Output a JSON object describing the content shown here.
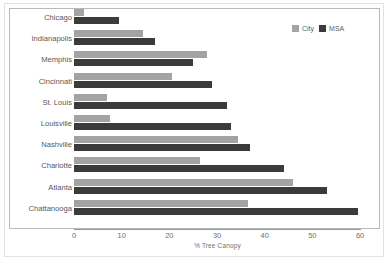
{
  "chart_data": {
    "type": "bar",
    "orientation": "horizontal",
    "title": "",
    "xlabel": "% Tree Canopy",
    "ylabel": "",
    "xlim": [
      0,
      60
    ],
    "xticks": [
      0,
      10,
      20,
      30,
      40,
      50,
      60
    ],
    "grid": false,
    "legend_position": "top-right",
    "categories": [
      "Chicago",
      "Indianapolis",
      "Memphis",
      "Cincinnati",
      "St. Louis",
      "Louisville",
      "Nashville",
      "Charlotte",
      "Atlanta",
      "Chattanooga"
    ],
    "series": [
      {
        "name": "City",
        "color": "#a3a3a3",
        "values": [
          2,
          14.5,
          28,
          20.5,
          7,
          7.5,
          34.5,
          26.5,
          46,
          36.5
        ]
      },
      {
        "name": "MSA",
        "color": "#3b3b3b",
        "values": [
          9.5,
          17,
          25,
          29,
          32,
          33,
          37,
          44,
          53,
          59.5
        ]
      }
    ]
  },
  "legend": {
    "items": [
      {
        "label": "City",
        "color": "#a3a3a3"
      },
      {
        "label": "MSA",
        "color": "#3b3b3b"
      }
    ]
  },
  "axis": {
    "x_title": "% Tree Canopy",
    "x_tick_labels": [
      "0",
      "10",
      "20",
      "30",
      "40",
      "50",
      "60"
    ]
  }
}
